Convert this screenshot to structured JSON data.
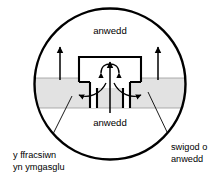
{
  "figure": {
    "colors": {
      "outline": "#000000",
      "liquid_band": "#e2e2e2",
      "background": "#ffffff",
      "band_edge": "#9a9a9a"
    },
    "circle": {
      "cx": 110,
      "cy": 84,
      "r": 76
    },
    "liquid_band": {
      "top_y": 78,
      "bottom_y": 108
    },
    "labels": {
      "vapour_top": "anwedd",
      "vapour_bottom": "anwedd",
      "fraction_collecting": {
        "line1": "y ffracsiwn",
        "line2": "yn ymgasglu"
      },
      "vapour_bubbles": {
        "line1": "swigod o",
        "line2": "anwedd"
      }
    },
    "arrows": {
      "left_riser": {
        "x": 60,
        "from_y": 80,
        "to_y": 47
      },
      "right_riser": {
        "x": 158,
        "from_y": 80,
        "to_y": 47
      },
      "center_riser": {
        "x": 110,
        "from_y": 113,
        "to_y": 62
      }
    }
  }
}
